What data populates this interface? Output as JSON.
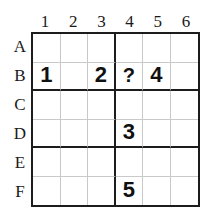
{
  "puzzle": {
    "type": "sudoku-grid",
    "rows": 6,
    "cols": 6,
    "block_rows": 2,
    "block_cols": 3,
    "column_headers": [
      "1",
      "2",
      "3",
      "4",
      "5",
      "6"
    ],
    "row_headers": [
      "A",
      "B",
      "C",
      "D",
      "E",
      "F"
    ],
    "colors": {
      "background": "#ffffff",
      "outer_border": "#1c1c1c",
      "block_border": "#1c1c1c",
      "cell_border": "#c9c9c9",
      "digit": "#101010",
      "label": "#1a1a1a"
    },
    "cells": [
      [
        "",
        "",
        "",
        "",
        "",
        ""
      ],
      [
        "1",
        "",
        "2",
        "?",
        "4",
        ""
      ],
      [
        "",
        "",
        "",
        "",
        "",
        ""
      ],
      [
        "",
        "",
        "",
        "3",
        "",
        ""
      ],
      [
        "",
        "",
        "",
        "",
        "",
        ""
      ],
      [
        "",
        "",
        "",
        "5",
        "",
        ""
      ]
    ],
    "filled": [
      {
        "row": "B",
        "col": "1",
        "value": "1"
      },
      {
        "row": "B",
        "col": "3",
        "value": "2"
      },
      {
        "row": "B",
        "col": "4",
        "value": "?"
      },
      {
        "row": "B",
        "col": "5",
        "value": "4"
      },
      {
        "row": "D",
        "col": "4",
        "value": "3"
      },
      {
        "row": "F",
        "col": "4",
        "value": "5"
      }
    ],
    "unknown_marker": "?"
  }
}
